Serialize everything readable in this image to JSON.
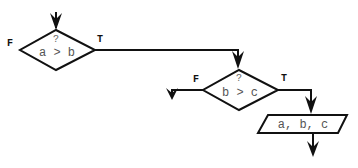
{
  "diagram": {
    "type": "flowchart",
    "colors": {
      "line": "#111111",
      "text": "#555555",
      "background": "#ffffff"
    },
    "decision1": {
      "question_mark": "?",
      "condition": "a > b",
      "false_label": "F",
      "true_label": "T"
    },
    "decision2": {
      "question_mark": "?",
      "condition": "b > c",
      "false_label": "F",
      "true_label": "T"
    },
    "output": {
      "text": "a, b, c"
    }
  }
}
